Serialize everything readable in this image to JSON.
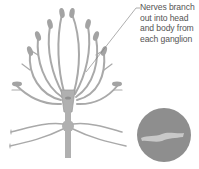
{
  "annotation": {
    "lines": [
      "Nerves branch",
      "out into head",
      "and body from",
      "each ganglion"
    ]
  },
  "colors": {
    "nerve": "#a9a9a9",
    "nerve_dark": "#9a9a9a",
    "ganglion": "#b0b0b0",
    "cross_section_bg": "#8e8e8e",
    "cross_section_fiber": "#c8c8c8",
    "leader_line": "#777777",
    "text": "#555555"
  },
  "figure": {
    "main": "nerve-branching-diagram",
    "inset": "nerve-cross-section"
  }
}
